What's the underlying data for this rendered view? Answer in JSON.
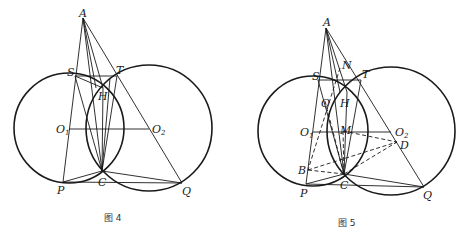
{
  "figures": [
    {
      "caption": "图 4",
      "points": {
        "A": "A",
        "S": "S",
        "T": "T",
        "H": "H",
        "O1": "O",
        "O2": "O",
        "C": "C",
        "P": "P",
        "Q": "Q"
      },
      "subscripts": {
        "O1": "1",
        "O2": "2"
      },
      "circles": [
        "O1",
        "O2"
      ],
      "solid_segments": [
        "A-P",
        "A-Q",
        "A-C",
        "A-H",
        "S-T",
        "S-C",
        "S-H",
        "T-C",
        "H-C",
        "O1-O2",
        "P-C",
        "C-Q",
        "P-Q"
      ]
    },
    {
      "caption": "图 5",
      "points": {
        "A": "A",
        "N": "N",
        "S": "S",
        "T": "T",
        "O": "O",
        "H": "H",
        "O1": "O",
        "M": "M",
        "O2": "O",
        "D": "D",
        "B": "B",
        "C": "C",
        "P": "P",
        "Q": "Q"
      },
      "subscripts": {
        "O1": "1",
        "O2": "2"
      },
      "circles": [
        "O1",
        "O2"
      ],
      "solid_segments": [
        "A-P",
        "A-Q",
        "A-C",
        "A-H",
        "S-T",
        "S-C",
        "T-C",
        "H-C",
        "O1-O2",
        "P-C",
        "C-Q",
        "P-Q"
      ],
      "dashed_segments": [
        "N-B",
        "O-C",
        "M-D",
        "B-D",
        "B-C",
        "C-D",
        "M-C"
      ]
    }
  ]
}
